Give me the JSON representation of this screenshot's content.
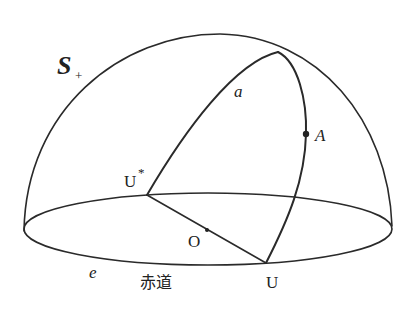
{
  "diagram": {
    "type": "hemisphere-great-circles",
    "labels": {
      "hemisphere": "S",
      "hemisphere_sub": "+",
      "great_circle": "a",
      "point_A": "A",
      "point_U_star": "U",
      "point_U_star_sup": "*",
      "point_O": "O",
      "point_U": "U",
      "equator_curve": "e",
      "equator_name": "赤道"
    },
    "colors": {
      "line": "#2a2a2a",
      "background": "#ffffff"
    }
  }
}
